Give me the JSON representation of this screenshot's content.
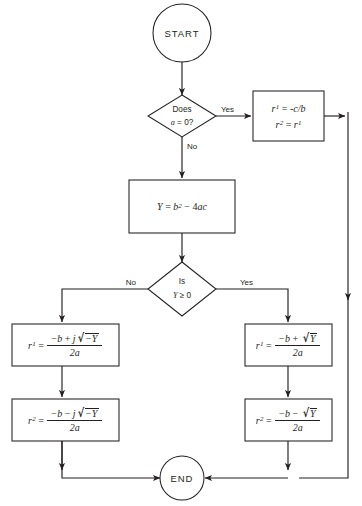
{
  "diagram": {
    "type": "flowchart",
    "background_color": "#ffffff",
    "line_color": "#231f20"
  },
  "nodes": {
    "start": {
      "label": "START",
      "shape": "terminator"
    },
    "decision_a": {
      "line1": "Does",
      "line2_var": "a",
      "line2_rest": " = 0?",
      "shape": "decision"
    },
    "box_linear": {
      "shape": "process",
      "r1_lhs_var": "r",
      "r1_lhs_sub": "1",
      "r1_eq": "=",
      "r1_rhs": "-c/b",
      "r2_lhs_var": "r",
      "r2_lhs_sub": "2",
      "r2_eq": "=",
      "r2_rhs_var": "r",
      "r2_rhs_sub": "1"
    },
    "box_discriminant": {
      "shape": "process",
      "lhs": "Y",
      "eq": "=",
      "b": "b",
      "b_exp": "2",
      "minus": "−",
      "four": "4",
      "ac": "ac"
    },
    "decision_y": {
      "line1": "Is",
      "line2_var": "Y",
      "line2_rest": " ≥ 0",
      "shape": "decision"
    },
    "box_complex_r1": {
      "shape": "process",
      "lhs_var": "r",
      "lhs_sub": "1",
      "eq": "=",
      "num_minus_b": "−b",
      "num_op": "+",
      "num_j": "j",
      "num_radicand": "−Y",
      "den": "2a"
    },
    "box_complex_r2": {
      "shape": "process",
      "lhs_var": "r",
      "lhs_sub": "2",
      "eq": "=",
      "num_minus_b": "−b",
      "num_op": "−",
      "num_j": "j",
      "num_radicand": "−Y",
      "den": "2a"
    },
    "box_real_r1": {
      "shape": "process",
      "lhs_var": "r",
      "lhs_sub": "1",
      "eq": "=",
      "num_minus_b": "−b",
      "num_op": "+",
      "num_radicand": "Y",
      "den": "2a"
    },
    "box_real_r2": {
      "shape": "process",
      "lhs_var": "r",
      "lhs_sub": "2",
      "eq": "=",
      "num_minus_b": "−b",
      "num_op": "−",
      "num_radicand": "Y",
      "den": "2a"
    },
    "end": {
      "label": "END",
      "shape": "terminator"
    }
  },
  "edge_labels": {
    "a_yes": "Yes",
    "a_no": "No",
    "y_no": "No",
    "y_yes": "Yes"
  }
}
